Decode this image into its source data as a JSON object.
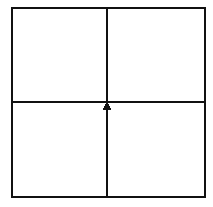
{
  "figure": {
    "title": "",
    "type": "line-diagram",
    "background_color": "#ffffff",
    "stroke_color": "#111111",
    "canvas": {
      "width": 213,
      "height": 207
    },
    "outer_square": {
      "name": "outer-square-border",
      "x": 12,
      "y": 8,
      "width": 193,
      "height": 189,
      "stroke_width": 2.4,
      "fill": "#ffffff"
    },
    "divider_horizontal": {
      "name": "horizontal-divider-line",
      "x1": 12,
      "y1": 102,
      "x2": 205,
      "y2": 102,
      "stroke_width": 1.6
    },
    "divider_vertical": {
      "name": "vertical-divider-line",
      "x1": 107,
      "y1": 8,
      "x2": 107,
      "y2": 197,
      "stroke_width": 1.6
    },
    "arrow_marker": {
      "name": "up-arrow-marker",
      "description": "solid upward-pointing triangle at center intersection",
      "direction": "up",
      "apex_x": 107,
      "apex_y": 101,
      "base_y": 110,
      "half_width": 4.6,
      "fill": "#111111"
    },
    "quadrants": [
      {
        "name": "quadrant-top-left",
        "label": ""
      },
      {
        "name": "quadrant-top-right",
        "label": ""
      },
      {
        "name": "quadrant-bottom-left",
        "label": ""
      },
      {
        "name": "quadrant-bottom-right",
        "label": ""
      }
    ]
  }
}
